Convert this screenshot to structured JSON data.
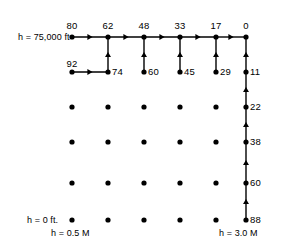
{
  "figure": {
    "type": "dynamic-programming-grid-network",
    "axis_labels": {
      "top_left_altitude": "h = 75,000 ft",
      "bottom_left_altitude": "h = 0 ft.",
      "bottom_left_mach": "h = 0.5 M",
      "bottom_right_mach": "h = 3.0 M"
    },
    "geometry": {
      "col_x": [
        72,
        108,
        144,
        180,
        216,
        246
      ],
      "row_y": [
        37,
        72,
        107,
        142,
        183,
        220
      ],
      "dot_radius": 2.6,
      "line_width": 1.4,
      "stroke": "#000000"
    },
    "nodes": [
      {
        "col": 0,
        "row": 0,
        "label": "80",
        "label_pos": "above"
      },
      {
        "col": 1,
        "row": 0,
        "label": "62",
        "label_pos": "above"
      },
      {
        "col": 2,
        "row": 0,
        "label": "48",
        "label_pos": "above"
      },
      {
        "col": 3,
        "row": 0,
        "label": "33",
        "label_pos": "above"
      },
      {
        "col": 4,
        "row": 0,
        "label": "17",
        "label_pos": "above"
      },
      {
        "col": 5,
        "row": 0,
        "label": "0",
        "label_pos": "above"
      },
      {
        "col": 0,
        "row": 1,
        "label": "92",
        "label_pos": "above-left"
      },
      {
        "col": 1,
        "row": 1,
        "label": "74",
        "label_pos": "right"
      },
      {
        "col": 2,
        "row": 1,
        "label": "60",
        "label_pos": "right"
      },
      {
        "col": 3,
        "row": 1,
        "label": "45",
        "label_pos": "right"
      },
      {
        "col": 4,
        "row": 1,
        "label": "29",
        "label_pos": "right"
      },
      {
        "col": 5,
        "row": 1,
        "label": "11",
        "label_pos": "right"
      },
      {
        "col": 0,
        "row": 2,
        "label": ""
      },
      {
        "col": 1,
        "row": 2,
        "label": ""
      },
      {
        "col": 2,
        "row": 2,
        "label": ""
      },
      {
        "col": 3,
        "row": 2,
        "label": ""
      },
      {
        "col": 4,
        "row": 2,
        "label": ""
      },
      {
        "col": 5,
        "row": 2,
        "label": "22",
        "label_pos": "right"
      },
      {
        "col": 0,
        "row": 3,
        "label": ""
      },
      {
        "col": 1,
        "row": 3,
        "label": ""
      },
      {
        "col": 2,
        "row": 3,
        "label": ""
      },
      {
        "col": 3,
        "row": 3,
        "label": ""
      },
      {
        "col": 4,
        "row": 3,
        "label": ""
      },
      {
        "col": 5,
        "row": 3,
        "label": "38",
        "label_pos": "right"
      },
      {
        "col": 0,
        "row": 4,
        "label": ""
      },
      {
        "col": 1,
        "row": 4,
        "label": ""
      },
      {
        "col": 2,
        "row": 4,
        "label": ""
      },
      {
        "col": 3,
        "row": 4,
        "label": ""
      },
      {
        "col": 4,
        "row": 4,
        "label": ""
      },
      {
        "col": 5,
        "row": 4,
        "label": "60",
        "label_pos": "right"
      },
      {
        "col": 0,
        "row": 5,
        "label": ""
      },
      {
        "col": 1,
        "row": 5,
        "label": ""
      },
      {
        "col": 2,
        "row": 5,
        "label": ""
      },
      {
        "col": 3,
        "row": 5,
        "label": ""
      },
      {
        "col": 4,
        "row": 5,
        "label": ""
      },
      {
        "col": 5,
        "row": 5,
        "label": "88",
        "label_pos": "right"
      }
    ],
    "arcs": [
      {
        "from": {
          "col": 0,
          "row": 0
        },
        "to": {
          "col": 1,
          "row": 0
        },
        "dir": "right"
      },
      {
        "from": {
          "col": 1,
          "row": 0
        },
        "to": {
          "col": 2,
          "row": 0
        },
        "dir": "right"
      },
      {
        "from": {
          "col": 2,
          "row": 0
        },
        "to": {
          "col": 3,
          "row": 0
        },
        "dir": "right"
      },
      {
        "from": {
          "col": 3,
          "row": 0
        },
        "to": {
          "col": 4,
          "row": 0
        },
        "dir": "right"
      },
      {
        "from": {
          "col": 4,
          "row": 0
        },
        "to": {
          "col": 5,
          "row": 0
        },
        "dir": "right"
      },
      {
        "from": {
          "col": 0,
          "row": 1
        },
        "to": {
          "col": 1,
          "row": 1
        },
        "dir": "right"
      },
      {
        "from": {
          "col": 1,
          "row": 1
        },
        "to": {
          "col": 1,
          "row": 0
        },
        "dir": "up"
      },
      {
        "from": {
          "col": 2,
          "row": 1
        },
        "to": {
          "col": 2,
          "row": 0
        },
        "dir": "up"
      },
      {
        "from": {
          "col": 3,
          "row": 1
        },
        "to": {
          "col": 3,
          "row": 0
        },
        "dir": "up"
      },
      {
        "from": {
          "col": 4,
          "row": 1
        },
        "to": {
          "col": 4,
          "row": 0
        },
        "dir": "up"
      },
      {
        "from": {
          "col": 5,
          "row": 1
        },
        "to": {
          "col": 5,
          "row": 0
        },
        "dir": "up"
      },
      {
        "from": {
          "col": 5,
          "row": 2
        },
        "to": {
          "col": 5,
          "row": 1
        },
        "dir": "up"
      },
      {
        "from": {
          "col": 5,
          "row": 3
        },
        "to": {
          "col": 5,
          "row": 2
        },
        "dir": "up"
      },
      {
        "from": {
          "col": 5,
          "row": 4
        },
        "to": {
          "col": 5,
          "row": 3
        },
        "dir": "up"
      },
      {
        "from": {
          "col": 5,
          "row": 5
        },
        "to": {
          "col": 5,
          "row": 4
        },
        "dir": "up"
      }
    ],
    "label_positions": {
      "top_left_altitude": {
        "x": 18,
        "y": 33
      },
      "bottom_left_altitude": {
        "x": 27,
        "y": 216
      },
      "bottom_left_mach": {
        "x": 51,
        "y": 229
      },
      "bottom_right_mach": {
        "x": 219,
        "y": 229
      }
    }
  }
}
